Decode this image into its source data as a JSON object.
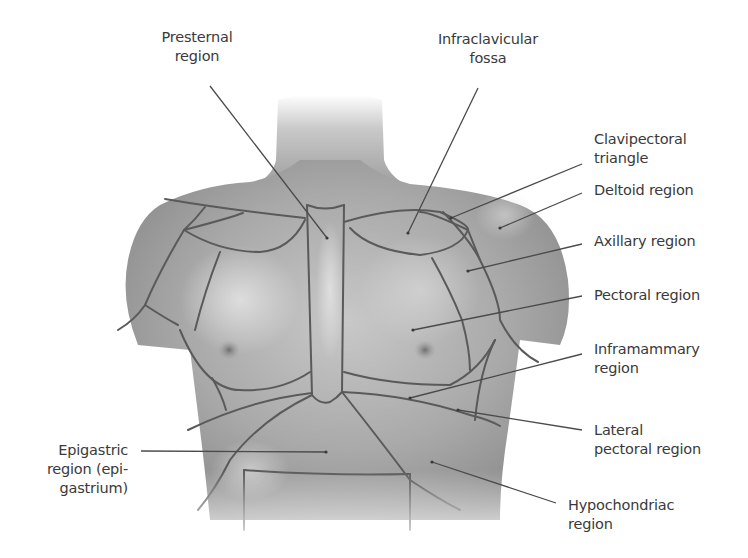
{
  "figure": {
    "line_color": "#4a4a4a",
    "region_line_color": "#5a5a5a",
    "text_color": "#3a3a3a"
  },
  "labels": {
    "presternal": {
      "line1": "Presternal",
      "line2": "region"
    },
    "infraclavicular": {
      "line1": "Infraclavicular",
      "line2": "fossa"
    },
    "clavipectoral": {
      "line1": "Clavipectoral",
      "line2": "triangle"
    },
    "deltoid": {
      "line1": "Deltoid region"
    },
    "axillary": {
      "line1": "Axillary region"
    },
    "pectoral": {
      "line1": "Pectoral region"
    },
    "inframammary": {
      "line1": "Inframammary",
      "line2": "region"
    },
    "lateral_pectoral": {
      "line1": "Lateral",
      "line2": "pectoral region"
    },
    "hypochondriac": {
      "line1": "Hypochondriac",
      "line2": "region"
    },
    "epigastric": {
      "line1": "Epigastric",
      "line2": "region (epi-",
      "line3": "gastrium)"
    }
  }
}
